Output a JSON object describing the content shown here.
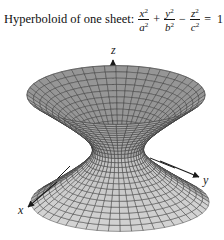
{
  "title": {
    "label": "Hyperboloid of one sheet:",
    "equation": {
      "terms": [
        {
          "num": "x",
          "den": "a",
          "exp": "2"
        },
        {
          "op": "+"
        },
        {
          "num": "y",
          "den": "b",
          "exp": "2"
        },
        {
          "op": "−"
        },
        {
          "num": "z",
          "den": "c",
          "exp": "2"
        },
        {
          "op": "="
        },
        {
          "value": "1"
        }
      ],
      "text": "x²/a² + y²/b² − z²/c² = 1"
    }
  },
  "figure": {
    "axes": {
      "x": "x",
      "y": "y",
      "z": "z"
    },
    "surface": "hyperboloid of one sheet",
    "colors": {
      "surface_top": "#9a9a9a",
      "surface_bottom": "#d6d6d6",
      "grid": "#333333",
      "axis": "#1a1a1a"
    }
  }
}
